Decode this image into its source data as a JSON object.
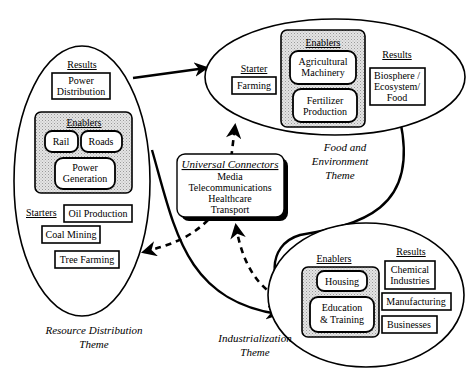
{
  "diagram": {
    "resource_theme": {
      "label_line1": "Resource Distribution",
      "label_line2": "Theme",
      "results_heading": "Results",
      "results": [
        "Power",
        "Distribution"
      ],
      "enablers_heading": "Enablers",
      "enablers": {
        "rail": "Rail",
        "roads": "Roads",
        "power_gen_1": "Power",
        "power_gen_2": "Generation"
      },
      "starters_heading": "Starters",
      "starters": {
        "oil": "Oil Production",
        "coal": "Coal Mining",
        "tree": "Tree Farming"
      }
    },
    "food_theme": {
      "label_line1": "Food and",
      "label_line2": "Environment",
      "label_line3": "Theme",
      "starter_heading": "Starter",
      "starter": "Farming",
      "enablers_heading": "Enablers",
      "enablers": {
        "ag_1": "Agricultural",
        "ag_2": "Machinery",
        "fert_1": "Fertilizer",
        "fert_2": "Production"
      },
      "results_heading": "Results",
      "results": {
        "line1": "Biosphere /",
        "line2": "Ecosystem/",
        "line3": "Food"
      }
    },
    "industrial_theme": {
      "label_line1": "Industrialization",
      "label_line2": "Theme",
      "enablers_heading": "Enablers",
      "enablers": {
        "housing": "Housing",
        "edu_1": "Education",
        "edu_2": "& Training"
      },
      "results_heading": "Results",
      "results": {
        "chem_1": "Chemical",
        "chem_2": "Industries",
        "manufacturing": "Manufacturing",
        "businesses": "Businesses"
      }
    },
    "universal_connectors": {
      "heading": "Universal Connectors",
      "items": [
        "Media",
        "Telecommunications",
        "Healthcare",
        "Transport"
      ]
    }
  }
}
